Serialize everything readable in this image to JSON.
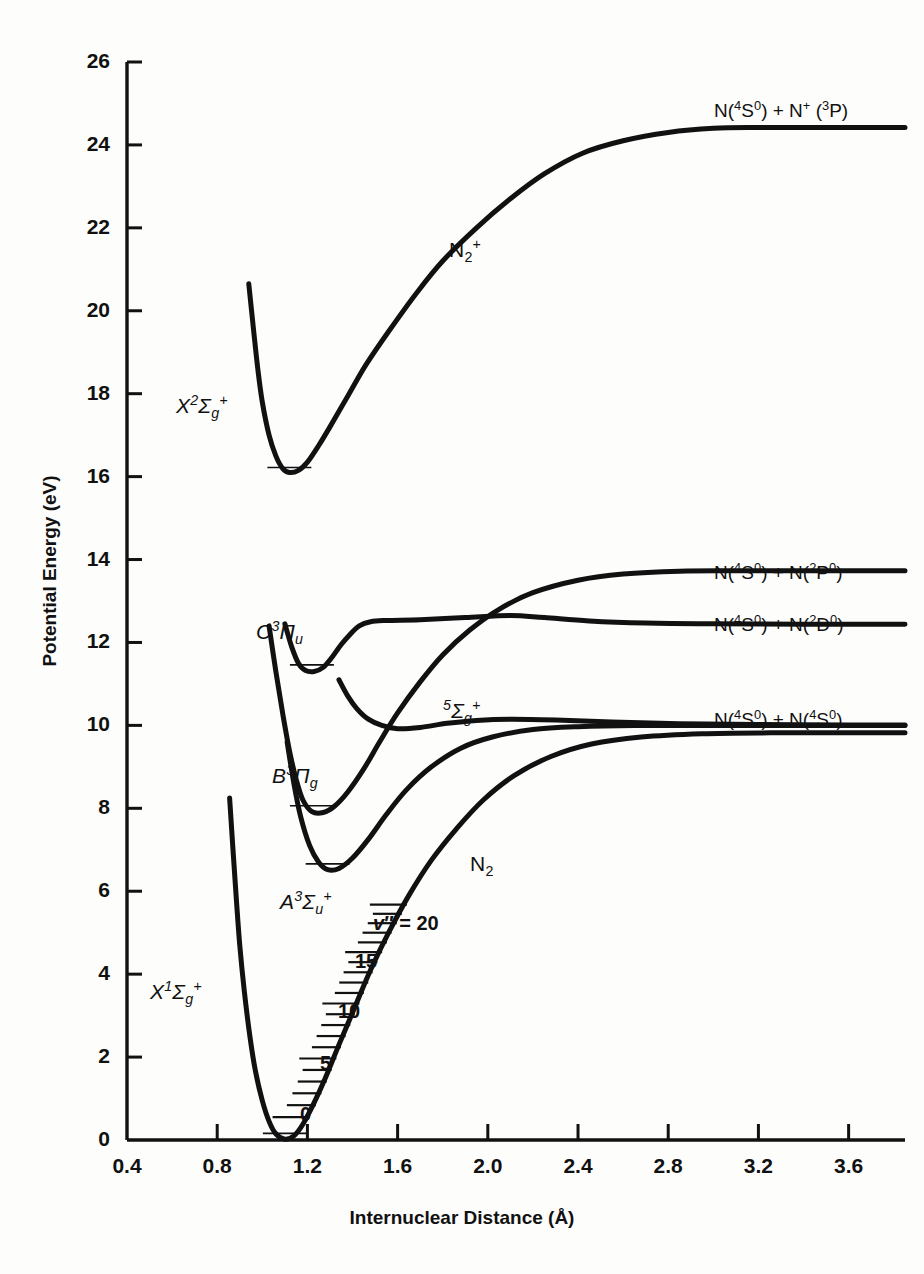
{
  "chart_data": {
    "type": "line",
    "title": "",
    "xlabel": "Internuclear Distance (Å)",
    "ylabel": "Potential Energy (eV)",
    "xlim": [
      0.4,
      3.85
    ],
    "ylim": [
      0,
      26
    ],
    "grid": false,
    "legend_position": "none",
    "xticks": [
      "0.4",
      "0.8",
      "1.2",
      "1.6",
      "2.0",
      "2.4",
      "2.8",
      "3.2",
      "3.6"
    ],
    "xtick_values": [
      0.4,
      0.8,
      1.2,
      1.6,
      2.0,
      2.4,
      2.8,
      3.2,
      3.6
    ],
    "yticks": [
      "0",
      "2",
      "4",
      "6",
      "8",
      "10",
      "12",
      "14",
      "16",
      "18",
      "20",
      "22",
      "24",
      "26"
    ],
    "ytick_values": [
      0,
      2,
      4,
      6,
      8,
      10,
      12,
      14,
      16,
      18,
      20,
      22,
      24,
      26
    ],
    "series": [
      {
        "name": "N2+ X 2Sigma_g+",
        "label": "X²Σg⁺",
        "molecule": "N2+",
        "dissociation_limit": 24.4,
        "well_minimum": {
          "r": 1.12,
          "E": 16.1
        },
        "points": [
          [
            0.94,
            20.65
          ],
          [
            0.96,
            19.6
          ],
          [
            0.98,
            18.6
          ],
          [
            1.0,
            17.8
          ],
          [
            1.03,
            17.0
          ],
          [
            1.06,
            16.5
          ],
          [
            1.09,
            16.2
          ],
          [
            1.12,
            16.1
          ],
          [
            1.16,
            16.15
          ],
          [
            1.2,
            16.35
          ],
          [
            1.25,
            16.75
          ],
          [
            1.3,
            17.2
          ],
          [
            1.38,
            17.95
          ],
          [
            1.46,
            18.7
          ],
          [
            1.56,
            19.5
          ],
          [
            1.68,
            20.4
          ],
          [
            1.8,
            21.2
          ],
          [
            1.95,
            22.0
          ],
          [
            2.1,
            22.7
          ],
          [
            2.25,
            23.3
          ],
          [
            2.42,
            23.8
          ],
          [
            2.6,
            24.1
          ],
          [
            2.8,
            24.3
          ],
          [
            3.0,
            24.4
          ],
          [
            3.2,
            24.42
          ],
          [
            3.5,
            24.42
          ],
          [
            3.85,
            24.42
          ]
        ]
      },
      {
        "name": "N2 C 3Pi_u",
        "label": "C³Πu",
        "molecule": "N2",
        "dissociation_limit": 12.5,
        "well_minimum": {
          "r": 1.22,
          "E": 11.3
        },
        "points": [
          [
            1.1,
            12.45
          ],
          [
            1.13,
            11.9
          ],
          [
            1.16,
            11.5
          ],
          [
            1.19,
            11.33
          ],
          [
            1.23,
            11.3
          ],
          [
            1.27,
            11.4
          ],
          [
            1.31,
            11.65
          ],
          [
            1.35,
            11.95
          ],
          [
            1.39,
            12.2
          ],
          [
            1.43,
            12.4
          ],
          [
            1.48,
            12.5
          ],
          [
            1.55,
            12.53
          ],
          [
            1.7,
            12.55
          ],
          [
            1.9,
            12.6
          ],
          [
            2.1,
            12.65
          ],
          [
            2.25,
            12.6
          ],
          [
            2.45,
            12.52
          ],
          [
            2.7,
            12.47
          ],
          [
            3.0,
            12.45
          ],
          [
            3.4,
            12.44
          ],
          [
            3.85,
            12.44
          ]
        ]
      },
      {
        "name": "N2 B 3Pi_g",
        "label": "B³Πg",
        "molecule": "N2",
        "dissociation_limit": 13.7,
        "well_minimum": {
          "r": 1.22,
          "E": 7.9
        },
        "points": [
          [
            1.03,
            12.4
          ],
          [
            1.06,
            11.3
          ],
          [
            1.09,
            10.3
          ],
          [
            1.12,
            9.4
          ],
          [
            1.15,
            8.7
          ],
          [
            1.18,
            8.2
          ],
          [
            1.22,
            7.92
          ],
          [
            1.27,
            7.9
          ],
          [
            1.32,
            8.05
          ],
          [
            1.38,
            8.4
          ],
          [
            1.45,
            8.95
          ],
          [
            1.52,
            9.6
          ],
          [
            1.6,
            10.3
          ],
          [
            1.7,
            11.05
          ],
          [
            1.8,
            11.7
          ],
          [
            1.92,
            12.3
          ],
          [
            2.05,
            12.8
          ],
          [
            2.2,
            13.2
          ],
          [
            2.4,
            13.5
          ],
          [
            2.6,
            13.65
          ],
          [
            2.85,
            13.72
          ],
          [
            3.1,
            13.73
          ],
          [
            3.5,
            13.73
          ],
          [
            3.85,
            13.73
          ]
        ]
      },
      {
        "name": "N2 5Sigma_g+",
        "label": "⁵Σg⁺",
        "molecule": "N2",
        "dissociation_limit": 10.0,
        "points": [
          [
            1.34,
            11.1
          ],
          [
            1.38,
            10.7
          ],
          [
            1.42,
            10.4
          ],
          [
            1.47,
            10.15
          ],
          [
            1.53,
            10.0
          ],
          [
            1.6,
            9.92
          ],
          [
            1.7,
            9.95
          ],
          [
            1.82,
            10.05
          ],
          [
            1.95,
            10.12
          ],
          [
            2.1,
            10.15
          ],
          [
            2.3,
            10.13
          ],
          [
            2.55,
            10.08
          ],
          [
            2.85,
            10.04
          ],
          [
            3.2,
            10.02
          ],
          [
            3.6,
            10.01
          ],
          [
            3.85,
            10.01
          ]
        ]
      },
      {
        "name": "N2 A 3Sigma_u+",
        "label": "A³Σu⁺",
        "molecule": "N2",
        "dissociation_limit": 10.0,
        "well_minimum": {
          "r": 1.29,
          "E": 6.5
        },
        "points": [
          [
            1.11,
            9.6
          ],
          [
            1.14,
            8.6
          ],
          [
            1.17,
            7.8
          ],
          [
            1.21,
            7.1
          ],
          [
            1.25,
            6.7
          ],
          [
            1.29,
            6.52
          ],
          [
            1.34,
            6.55
          ],
          [
            1.4,
            6.8
          ],
          [
            1.47,
            7.25
          ],
          [
            1.55,
            7.85
          ],
          [
            1.64,
            8.45
          ],
          [
            1.75,
            9.0
          ],
          [
            1.88,
            9.45
          ],
          [
            2.02,
            9.72
          ],
          [
            2.2,
            9.9
          ],
          [
            2.4,
            9.97
          ],
          [
            2.65,
            10.0
          ],
          [
            3.0,
            10.0
          ],
          [
            3.4,
            10.0
          ],
          [
            3.85,
            10.0
          ]
        ]
      },
      {
        "name": "N2 X 1Sigma_g+",
        "label": "X¹Σg⁺",
        "molecule": "N2",
        "dissociation_limit": 9.76,
        "well_minimum": {
          "r": 1.1,
          "E": 0.0
        },
        "points": [
          [
            0.855,
            8.25
          ],
          [
            0.87,
            7.0
          ],
          [
            0.885,
            5.8
          ],
          [
            0.9,
            4.7
          ],
          [
            0.92,
            3.6
          ],
          [
            0.945,
            2.5
          ],
          [
            0.97,
            1.65
          ],
          [
            1.0,
            0.95
          ],
          [
            1.03,
            0.45
          ],
          [
            1.06,
            0.15
          ],
          [
            1.1,
            0.02
          ],
          [
            1.14,
            0.1
          ],
          [
            1.18,
            0.38
          ],
          [
            1.23,
            0.9
          ],
          [
            1.28,
            1.5
          ],
          [
            1.34,
            2.3
          ],
          [
            1.41,
            3.2
          ],
          [
            1.48,
            4.1
          ],
          [
            1.56,
            5.0
          ],
          [
            1.65,
            5.9
          ],
          [
            1.75,
            6.75
          ],
          [
            1.86,
            7.5
          ],
          [
            1.98,
            8.2
          ],
          [
            2.12,
            8.8
          ],
          [
            2.28,
            9.25
          ],
          [
            2.46,
            9.55
          ],
          [
            2.68,
            9.72
          ],
          [
            2.95,
            9.8
          ],
          [
            3.25,
            9.82
          ],
          [
            3.6,
            9.82
          ],
          [
            3.85,
            9.82
          ]
        ]
      }
    ],
    "vibrational_ladder": {
      "state": "N2 X 1Sigma_g+",
      "tick_label_prefix": "v″ = ",
      "labels": [
        {
          "text": "v″ = 20",
          "v": 20,
          "E": 5.45
        },
        {
          "text": "15",
          "v": 15,
          "E": 4.55
        },
        {
          "text": "10",
          "v": 10,
          "E": 3.35
        },
        {
          "text": "5",
          "v": 5,
          "E": 2.0
        },
        {
          "text": "0",
          "v": 0,
          "E": 0.55
        }
      ]
    },
    "annotations": [
      {
        "text": "N(⁴S⁰) + N⁺ (³P)",
        "role": "asymptote-label",
        "E": 24.4
      },
      {
        "text": "N(⁴S⁰) + N(²P⁰)",
        "role": "asymptote-label",
        "E": 13.73
      },
      {
        "text": "N(⁴S⁰) + N(²D⁰)",
        "role": "asymptote-label",
        "E": 12.44
      },
      {
        "text": "N(⁴S⁰) + N(⁴S⁰)",
        "role": "asymptote-label",
        "E": 10.0
      },
      {
        "text": "N₂⁺",
        "role": "species-label"
      },
      {
        "text": "N₂",
        "role": "species-label"
      }
    ]
  },
  "axes": {
    "x_title": "Internuclear Distance (Å)",
    "y_title": "Potential Energy (eV)",
    "x_ticks": [
      "0.4",
      "0.8",
      "1.2",
      "1.6",
      "2.0",
      "2.4",
      "2.8",
      "3.2",
      "3.6"
    ],
    "y_ticks": [
      "26",
      "24",
      "22",
      "20",
      "18",
      "16",
      "14",
      "12",
      "10",
      "8",
      "6",
      "4",
      "2",
      "0"
    ]
  },
  "state_labels": {
    "n2plus_x": {
      "base": "X",
      "sup": "2",
      "sym": "Σ",
      "sub": "g",
      "charge": "+"
    },
    "n2_c": {
      "base": "C",
      "sup": "3",
      "sym": "Π",
      "sub": "u",
      "charge": ""
    },
    "n2_b": {
      "base": "B",
      "sup": "3",
      "sym": "Π",
      "sub": "g",
      "charge": ""
    },
    "n2_quintet": {
      "base": "",
      "sup": "5",
      "sym": "Σ",
      "sub": "g",
      "charge": "+"
    },
    "n2_a": {
      "base": "A",
      "sup": "3",
      "sym": "Σ",
      "sub": "u",
      "charge": "+"
    },
    "n2_x": {
      "base": "X",
      "sup": "1",
      "sym": "Σ",
      "sub": "g",
      "charge": "+"
    }
  },
  "species": {
    "ion": {
      "symbol": "N",
      "sub": "2",
      "sup": "+"
    },
    "neutral": {
      "symbol": "N",
      "sub": "2",
      "sup": ""
    }
  },
  "asymptotes": {
    "ion_limit": {
      "a": "N(",
      "a_sup": "4",
      "a_mid": "S",
      "a_sup2": "0",
      "a_end": ") + N",
      "b_sup": "+",
      "b_mid": " (",
      "b_sup2": "3",
      "b_end": "P)"
    },
    "p_limit": {
      "text": "N(4S0) + N(2P0)"
    },
    "d_limit": {
      "text": "N(4S0) + N(2D0)"
    },
    "s_limit": {
      "text": "N(4S0) + N(4S0)"
    }
  },
  "vibrational": {
    "v20": "v″ = 20",
    "v15": "15",
    "v10": "10",
    "v5": "5",
    "v0": "0"
  },
  "colors": {
    "curve": "#111111",
    "axis": "#111111",
    "background": "#fdfdfc"
  }
}
